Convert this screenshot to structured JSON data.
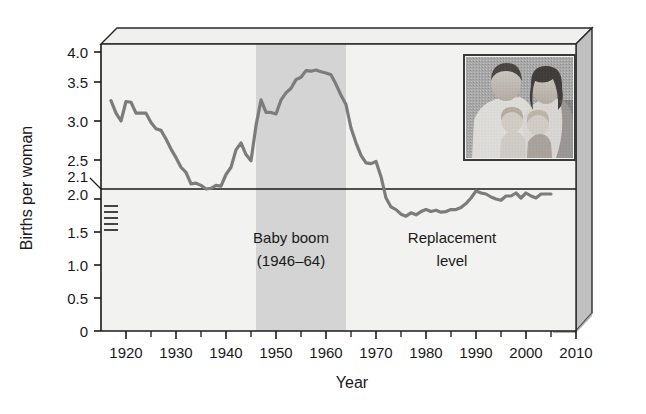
{
  "figure": {
    "alt_title": "U.S. total fertility rate, births per woman, 1917-2005",
    "background": "#ffffff",
    "plot_background": "#f2f2f0",
    "band_color": "#d4d4d4",
    "line_color": "#7c7c7c",
    "frame_color": "#2a2a2a",
    "extrusion_light": "#e8e8e6",
    "extrusion_dark": "#b8b8b8"
  },
  "chart_data": {
    "type": "line",
    "title": "",
    "xlabel": "Year",
    "ylabel": "Births per woman",
    "xlim": [
      1915,
      2010
    ],
    "ylim": [
      0,
      4.2
    ],
    "grid": false,
    "legend": "none",
    "x_ticks": [
      "1920",
      "1930",
      "1940",
      "1950",
      "1960",
      "1970",
      "1980",
      "1990",
      "2000",
      "2010"
    ],
    "x_tick_values": [
      1920,
      1930,
      1940,
      1950,
      1960,
      1970,
      1980,
      1990,
      2000,
      2010
    ],
    "x_minor_tick_values": [
      1925,
      1935,
      1945,
      1955,
      1965,
      1975,
      1985,
      1995,
      2005
    ],
    "y_ticks": [
      "0",
      "0.5",
      "1.0",
      "1.5",
      "2.0",
      "2.1",
      "2.5",
      "3.0",
      "3.5",
      "4.0"
    ],
    "y_tick_values": [
      0,
      0.5,
      1.0,
      1.5,
      2.0,
      2.1,
      2.5,
      3.0,
      3.5,
      4.0
    ],
    "axis_break_between": [
      1.5,
      2.0
    ],
    "axis_break_marks": 5,
    "reference_line": {
      "label": "Replacement level",
      "value": 2.1
    },
    "shaded_band": {
      "label": "Baby boom",
      "from": 1946,
      "to": 1964
    },
    "series": [
      {
        "name": "Births per woman",
        "x": [
          1917,
          1918,
          1919,
          1920,
          1921,
          1922,
          1923,
          1924,
          1925,
          1926,
          1927,
          1928,
          1929,
          1930,
          1931,
          1932,
          1933,
          1934,
          1935,
          1936,
          1937,
          1938,
          1939,
          1940,
          1941,
          1942,
          1943,
          1944,
          1945,
          1946,
          1947,
          1948,
          1949,
          1950,
          1951,
          1952,
          1953,
          1954,
          1955,
          1956,
          1957,
          1958,
          1959,
          1960,
          1961,
          1962,
          1963,
          1964,
          1965,
          1966,
          1967,
          1968,
          1969,
          1970,
          1971,
          1972,
          1973,
          1974,
          1975,
          1976,
          1977,
          1978,
          1979,
          1980,
          1981,
          1982,
          1983,
          1984,
          1985,
          1986,
          1987,
          1988,
          1989,
          1990,
          1991,
          1992,
          1993,
          1994,
          1995,
          1996,
          1997,
          1998,
          1999,
          2000,
          2001,
          2002,
          2003,
          2004,
          2005
        ],
        "values": [
          3.26,
          3.1,
          3.0,
          3.25,
          3.24,
          3.1,
          3.1,
          3.1,
          2.98,
          2.9,
          2.88,
          2.77,
          2.64,
          2.53,
          2.4,
          2.33,
          2.17,
          2.18,
          2.15,
          2.1,
          2.11,
          2.15,
          2.14,
          2.3,
          2.4,
          2.63,
          2.72,
          2.57,
          2.49,
          2.94,
          3.27,
          3.11,
          3.11,
          3.09,
          3.27,
          3.36,
          3.42,
          3.54,
          3.58,
          3.69,
          3.68,
          3.7,
          3.67,
          3.65,
          3.62,
          3.47,
          3.33,
          3.21,
          2.91,
          2.72,
          2.56,
          2.46,
          2.45,
          2.48,
          2.27,
          2.01,
          1.88,
          1.84,
          1.77,
          1.74,
          1.79,
          1.76,
          1.81,
          1.84,
          1.81,
          1.83,
          1.8,
          1.81,
          1.84,
          1.84,
          1.87,
          1.93,
          2.01,
          2.08,
          2.06,
          2.05,
          2.02,
          2.0,
          1.98,
          2.03,
          2.03,
          2.06,
          2.01,
          2.06,
          2.03,
          2.01,
          2.05,
          2.05,
          2.05
        ]
      }
    ]
  },
  "annotations": {
    "baby_boom_line1": "Baby boom",
    "baby_boom_line2": "(1946–64)",
    "replacement_line1": "Replacement",
    "replacement_line2": "level"
  },
  "axis": {
    "y_title": "Births per woman",
    "x_title": "Year"
  },
  "inset": {
    "name": "family-photo",
    "caption": ""
  }
}
